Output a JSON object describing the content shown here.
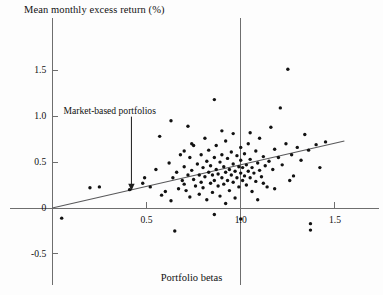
{
  "chart_data": {
    "type": "scatter",
    "title": "Mean monthly excess return (%)",
    "subtitle": "",
    "xlabel": "Portfolio betas",
    "ylabel": "Mean monthly excess return (%)",
    "xlim": [
      -0.15,
      1.67
    ],
    "ylim": [
      -0.62,
      1.72
    ],
    "xticks": [
      0.5,
      1.0,
      1.5
    ],
    "xtick_labels": [
      "0.5",
      "1.0",
      "1.5"
    ],
    "yticks": [
      -0.5,
      0,
      0.5,
      1.0,
      1.5
    ],
    "ytick_labels": [
      "-0.5",
      "0",
      "0.5",
      "1.0",
      "1.5"
    ],
    "grid": false,
    "legend": null,
    "annotations": [
      {
        "text": "Market-based portfolios",
        "x": 0.42,
        "y": 1.06,
        "arrow_to_x": 0.42,
        "arrow_to_y": 0.2
      }
    ],
    "reference_lines": [
      {
        "name": "vertical-at-beta-1",
        "orientation": "vertical",
        "value": 1.0
      },
      {
        "name": "horizontal-at-zero",
        "orientation": "horizontal",
        "value": 0
      }
    ],
    "fit_line": {
      "name": "security-market-line",
      "type": "linear",
      "x_start": 0.0,
      "y_start": 0.0,
      "x_end": 1.55,
      "y_end": 0.73,
      "slope": 0.471,
      "intercept": 0.0
    },
    "points": [
      [
        0.05,
        -0.11
      ],
      [
        0.2,
        0.22
      ],
      [
        0.25,
        0.23
      ],
      [
        0.41,
        0.2
      ],
      [
        0.48,
        0.27
      ],
      [
        0.49,
        0.33
      ],
      [
        0.52,
        0.23
      ],
      [
        0.55,
        0.42
      ],
      [
        0.58,
        0.14
      ],
      [
        0.6,
        0.18
      ],
      [
        0.62,
        0.49
      ],
      [
        0.63,
        0.08
      ],
      [
        0.64,
        0.33
      ],
      [
        0.65,
        -0.25
      ],
      [
        0.66,
        0.39
      ],
      [
        0.67,
        0.21
      ],
      [
        0.68,
        0.58
      ],
      [
        0.69,
        0.3
      ],
      [
        0.7,
        0.45
      ],
      [
        0.7,
        0.26
      ],
      [
        0.71,
        0.19
      ],
      [
        0.72,
        0.36
      ],
      [
        0.72,
        0.89
      ],
      [
        0.73,
        0.55
      ],
      [
        0.73,
        0.12
      ],
      [
        0.74,
        0.41
      ],
      [
        0.75,
        0.31
      ],
      [
        0.75,
        0.68
      ],
      [
        0.76,
        0.24
      ],
      [
        0.77,
        0.48
      ],
      [
        0.78,
        0.36
      ],
      [
        0.78,
        0.15
      ],
      [
        0.79,
        0.28
      ],
      [
        0.79,
        0.58
      ],
      [
        0.8,
        0.44
      ],
      [
        0.8,
        0.22
      ],
      [
        0.81,
        0.34
      ],
      [
        0.82,
        0.51
      ],
      [
        0.82,
        0.09
      ],
      [
        0.83,
        0.39
      ],
      [
        0.83,
        0.63
      ],
      [
        0.84,
        0.27
      ],
      [
        0.84,
        0.46
      ],
      [
        0.85,
        0.36
      ],
      [
        0.85,
        0.17
      ],
      [
        0.86,
        0.55
      ],
      [
        0.86,
        0.3
      ],
      [
        0.87,
        0.42
      ],
      [
        0.87,
        0.68
      ],
      [
        0.88,
        0.24
      ],
      [
        0.88,
        0.37
      ],
      [
        0.89,
        0.5
      ],
      [
        0.89,
        0.13
      ],
      [
        0.9,
        0.33
      ],
      [
        0.9,
        0.58
      ],
      [
        0.91,
        0.45
      ],
      [
        0.91,
        0.26
      ],
      [
        0.92,
        0.39
      ],
      [
        0.92,
        0.73
      ],
      [
        0.93,
        0.3
      ],
      [
        0.93,
        0.54
      ],
      [
        0.94,
        0.19
      ],
      [
        0.94,
        0.42
      ],
      [
        0.95,
        0.36
      ],
      [
        0.95,
        0.61
      ],
      [
        0.96,
        0.28
      ],
      [
        0.96,
        0.48
      ],
      [
        0.97,
        0.4
      ],
      [
        0.97,
        0.11
      ],
      [
        0.98,
        0.33
      ],
      [
        0.98,
        0.57
      ],
      [
        0.99,
        0.45
      ],
      [
        0.99,
        0.23
      ],
      [
        1.0,
        0.38
      ],
      [
        1.0,
        0.66
      ],
      [
        1.0,
        0.52
      ],
      [
        1.01,
        0.3
      ],
      [
        1.01,
        0.44
      ],
      [
        1.02,
        0.35
      ],
      [
        1.02,
        0.59
      ],
      [
        1.03,
        0.47
      ],
      [
        1.03,
        0.25
      ],
      [
        1.04,
        0.4
      ],
      [
        1.04,
        0.7
      ],
      [
        1.05,
        0.33
      ],
      [
        1.05,
        0.53
      ],
      [
        1.06,
        0.44
      ],
      [
        1.06,
        0.18
      ],
      [
        1.07,
        0.38
      ],
      [
        1.08,
        0.62
      ],
      [
        1.08,
        0.29
      ],
      [
        1.09,
        0.49
      ],
      [
        1.1,
        0.41
      ],
      [
        1.1,
        0.76
      ],
      [
        1.11,
        0.34
      ],
      [
        1.12,
        0.56
      ],
      [
        1.13,
        0.46
      ],
      [
        1.14,
        0.23
      ],
      [
        1.15,
        0.51
      ],
      [
        1.16,
        0.88
      ],
      [
        1.17,
        0.42
      ],
      [
        1.18,
        0.64
      ],
      [
        1.2,
        0.55
      ],
      [
        1.21,
        1.09
      ],
      [
        1.22,
        0.47
      ],
      [
        1.24,
        0.7
      ],
      [
        1.25,
        1.51
      ],
      [
        1.27,
        0.58
      ],
      [
        1.28,
        0.35
      ],
      [
        1.3,
        0.66
      ],
      [
        1.32,
        0.52
      ],
      [
        1.34,
        0.8
      ],
      [
        1.36,
        0.63
      ],
      [
        1.37,
        -0.17
      ],
      [
        1.37,
        -0.24
      ],
      [
        1.4,
        0.69
      ],
      [
        1.42,
        0.44
      ],
      [
        1.45,
        0.72
      ],
      [
        0.57,
        0.78
      ],
      [
        0.63,
        0.95
      ],
      [
        0.86,
        1.18
      ],
      [
        0.9,
        0.84
      ],
      [
        1.12,
        0.27
      ],
      [
        1.18,
        0.21
      ],
      [
        0.81,
        0.76
      ],
      [
        0.7,
        0.62
      ],
      [
        1.05,
        0.82
      ],
      [
        0.74,
        0.7
      ],
      [
        1.26,
        0.3
      ],
      [
        0.92,
        0.05
      ],
      [
        0.86,
        -0.07
      ],
      [
        1.0,
        -0.12
      ],
      [
        0.96,
        0.81
      ],
      [
        1.09,
        0.09
      ]
    ]
  }
}
